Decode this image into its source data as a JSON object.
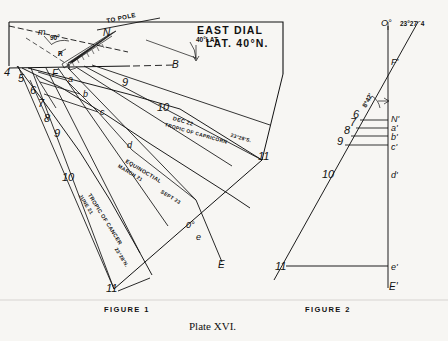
{
  "plate": {
    "caption": "Plate XVI."
  },
  "figure1": {
    "name": "FIGURE 1",
    "title_line1": "EAST  DIAL",
    "title_line2": "LAT. 40°N.",
    "gnomon": {
      "to_pole": "TO POLE",
      "node_n": "N",
      "node_f": "F",
      "node_m": "m",
      "angle_90": "90°",
      "angle_lat": "40°LAT.",
      "angle_r": "R"
    },
    "baseline_label": "B",
    "hour_lines": [
      "4",
      "5",
      "6",
      "7",
      "8",
      "9",
      "10",
      "11"
    ],
    "hour_right": [
      "9",
      "10",
      "11"
    ],
    "points": [
      "a",
      "b",
      "c",
      "d",
      "e"
    ],
    "point_e_end": "E",
    "declination_lines": [
      {
        "date": "DEC 22",
        "name": "TROPIC OF CAPRICORN",
        "dec": "23°28'S."
      },
      {
        "date": "MARCH 21",
        "name": "EQUINOCTIAL",
        "dec": "0°",
        "date2": "SEPT 23"
      },
      {
        "date": "JUNE 21",
        "name": "TROPIC OF CANCER",
        "dec": "23°28'N."
      }
    ]
  },
  "figure2": {
    "name": "FIGURE 2",
    "top_zero": "O°",
    "top_angle": "23°27'´4",
    "node_f": "F'",
    "node_n": "N'",
    "angle_small": "8°42'",
    "points": [
      "a'",
      "b'",
      "c'",
      "d'",
      "e'"
    ],
    "hours": [
      "6",
      "7",
      "8",
      "9",
      "10",
      "11"
    ],
    "bottom_e": "E'"
  },
  "colors": {
    "ink": "#111111",
    "paper": "#f7f6f3",
    "faint": "#444444"
  }
}
